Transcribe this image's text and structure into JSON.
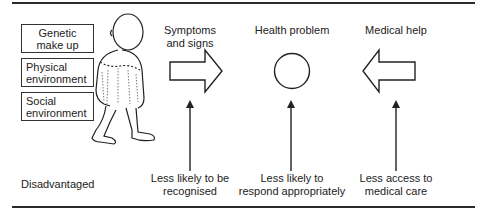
{
  "factors": [
    {
      "label_line1": "Genetic",
      "label_line2": "make up"
    },
    {
      "label_line1": "Physical",
      "label_line2": "environment"
    },
    {
      "label_line1": "Social",
      "label_line2": "environment"
    }
  ],
  "figure": {
    "icon": "walking-boy-illustration"
  },
  "stages": {
    "symptoms": {
      "line1": "Symptoms",
      "line2": "and signs",
      "icon": "right-arrow-outline"
    },
    "health": {
      "line1": "Health problem",
      "icon": "circle-outline"
    },
    "medical": {
      "line1": "Medical help",
      "icon": "left-arrow-outline"
    }
  },
  "bottom": {
    "disadvantaged": "Disadvantaged",
    "recognised": {
      "line1": "Less likely to be",
      "line2": "recognised"
    },
    "respond": {
      "line1": "Less likely to",
      "line2": "respond appropriately"
    },
    "access": {
      "line1": "Less access to",
      "line2": "medical care"
    }
  },
  "colors": {
    "ink": "#222222",
    "background": "#ffffff"
  }
}
